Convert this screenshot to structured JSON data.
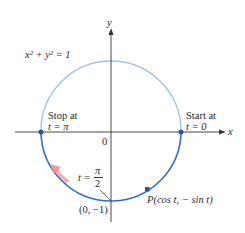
{
  "figure": {
    "equation_label": "x² + y² = 1",
    "axis_x_label": "x",
    "axis_y_label": "y",
    "origin_label": "0",
    "stop_label_line1": "Stop at",
    "stop_label_line2": "t = π",
    "start_label_line1": "Start at",
    "start_label_line2": "t = 0",
    "t_label_prefix": "t =",
    "t_label_num": "π",
    "t_label_den": "2",
    "bottom_point_label": "(0, −1)",
    "point_label": "P(cos t, − sin t)",
    "colors": {
      "circle_light": "#9dc3e6",
      "circle_dark": "#2f6fc6",
      "point": "#1f5aa8",
      "arrow": "#f08c8c",
      "axis": "#333333"
    }
  }
}
